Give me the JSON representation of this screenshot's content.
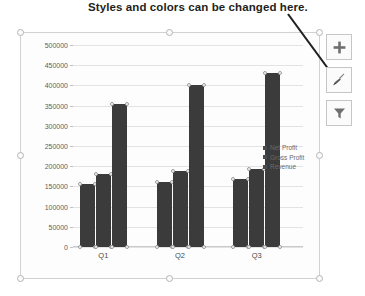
{
  "annotation": {
    "text": "Styles and colors can be changed here.",
    "leader_icon": "diagonal-leader-line"
  },
  "chart_tools": [
    {
      "name": "chart-elements-button",
      "icon": "plus-icon",
      "label": "+"
    },
    {
      "name": "chart-styles-button",
      "icon": "paintbrush-icon",
      "label": "Chart Styles"
    },
    {
      "name": "chart-filters-button",
      "icon": "funnel-icon",
      "label": "Chart Filters"
    }
  ],
  "chart_data": {
    "type": "bar",
    "title": "",
    "xlabel": "",
    "ylabel": "",
    "categories": [
      "Q1",
      "Q2",
      "Q3"
    ],
    "series": [
      {
        "name": "Net Profit",
        "values": [
          155000,
          160000,
          168000
        ]
      },
      {
        "name": "Gross Profit",
        "values": [
          180000,
          188000,
          193000
        ]
      },
      {
        "name": "Revenue",
        "values": [
          355000,
          402000,
          430000
        ]
      }
    ],
    "ylim": [
      0,
      500000
    ],
    "yticks": [
      0,
      50000,
      100000,
      150000,
      200000,
      250000,
      300000,
      350000,
      400000,
      450000,
      500000
    ],
    "ytick_labels": [
      "0",
      "50000",
      "100000",
      "150000",
      "200000",
      "250000",
      "300000",
      "350000",
      "400000",
      "450000",
      "500000"
    ],
    "grid": true,
    "legend_position": "right",
    "bar_color": "#3b3b3b",
    "gridline_color": "#e3e3e3",
    "plot_background": "#fdfdfd"
  },
  "selection": {
    "handles": [
      "top-left",
      "top-center",
      "top-right",
      "middle-left",
      "middle-right",
      "bottom-left",
      "bottom-center",
      "bottom-right"
    ]
  }
}
